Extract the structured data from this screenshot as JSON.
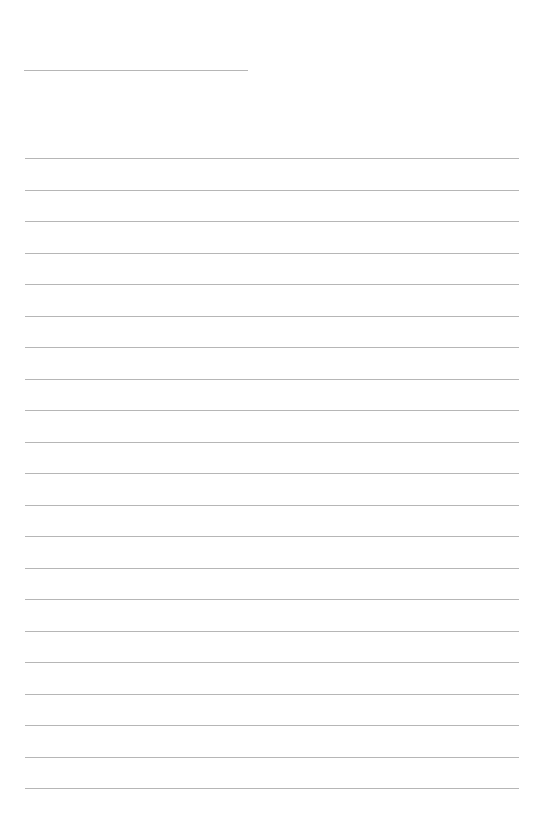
{
  "page": {
    "type": "lined-paper",
    "background_color": "#ffffff",
    "line_color": "#a9a9a9",
    "title_rule": {
      "top": 70,
      "left": 24,
      "width": 224
    },
    "lines": {
      "count": 21,
      "first_top": 158,
      "spacing": 31.5,
      "left": 25,
      "width": 494
    }
  }
}
